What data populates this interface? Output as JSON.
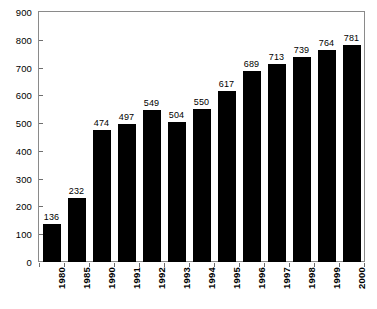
{
  "chart_data": {
    "type": "bar",
    "title": "",
    "subtitle": "",
    "xlabel": "",
    "ylabel": "",
    "categories": [
      "1980",
      "1985",
      "1990",
      "1991",
      "1992",
      "1993",
      "1994",
      "1995",
      "1996",
      "1997",
      "1998",
      "1999",
      "2000"
    ],
    "values": [
      136,
      232,
      474,
      497,
      549,
      504,
      550,
      617,
      689,
      713,
      739,
      764,
      781
    ],
    "data_labels": [
      "136",
      "232",
      "474",
      "497",
      "549",
      "504",
      "550",
      "617",
      "689",
      "713",
      "739",
      "764",
      "781"
    ],
    "ylim": [
      0,
      900
    ],
    "ytick_values": [
      0,
      100,
      200,
      300,
      400,
      500,
      600,
      700,
      800,
      900
    ],
    "ytick_labels": [
      "0",
      "100",
      "200",
      "300",
      "400",
      "500",
      "600",
      "700",
      "800",
      "900"
    ],
    "grid": false,
    "legend": null,
    "legend_position": "none",
    "bar_color": "#000000",
    "frame_color": "#8a8a8a",
    "label_rotation_deg": 90,
    "value_labels_shown": true,
    "annotations": []
  }
}
